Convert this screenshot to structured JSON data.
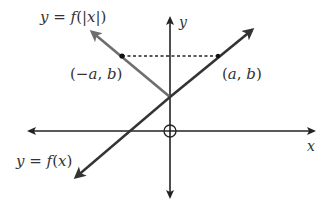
{
  "diagram": {
    "labels": {
      "f_abs": "y = f(|x|)",
      "f_abs_parts": [
        "y",
        " = ",
        "f",
        "(|",
        "x",
        "|)"
      ],
      "f_x": "y = f(x)",
      "f_x_parts": [
        "y",
        " = ",
        "f",
        "(",
        "x",
        ")"
      ],
      "y_axis": "y",
      "x_axis": "x",
      "point_left": "(−a, b)",
      "point_left_parts": [
        "(",
        "−",
        "a",
        ", ",
        "b",
        ")"
      ],
      "point_right": "(a, b)",
      "point_right_parts": [
        "(",
        "a",
        ", ",
        "b",
        ")"
      ]
    },
    "colors": {
      "axis": "#222222",
      "f_x_line": "#333333",
      "f_abs_left_branch": "#6e6e6e",
      "dashed": "#222222",
      "text": "#333333"
    },
    "elements": {
      "x_axis": {
        "from": [
          25,
          131
        ],
        "to": [
          318,
          131
        ]
      },
      "y_axis": {
        "from": [
          170,
          200
        ],
        "to": [
          170,
          14
        ]
      },
      "origin_marker": {
        "center": [
          170,
          131
        ],
        "r": 6
      },
      "f_x_line": {
        "from": [
          73,
          180
        ],
        "to": [
          256,
          27
        ]
      },
      "f_abs_left_branch": {
        "from": [
          170,
          97
        ],
        "to": [
          88,
          29
        ]
      },
      "point_left": [
        122,
        56
      ],
      "point_right": [
        218,
        56
      ]
    }
  }
}
